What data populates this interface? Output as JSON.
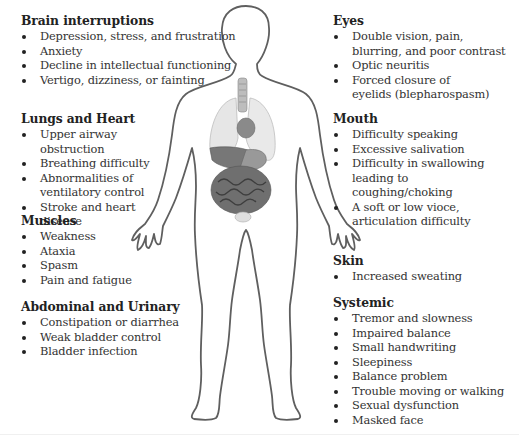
{
  "figure": {
    "outline_color": "#5a5a5a",
    "organ_colors": {
      "lungs": "#e4e4e4",
      "liver": "#7a7a7a",
      "stomach": "#8c8c8c",
      "intestines": "#6e6e6e",
      "bladder": "#dcdcdc"
    }
  },
  "sections": {
    "brain": {
      "title": "Brain interruptions",
      "items": [
        "Depression, stress, and frustration",
        "Anxiety",
        "Decline in intellectual functioning",
        "Vertigo, dizziness, or fainting"
      ]
    },
    "lungs_heart": {
      "title": "Lungs and Heart",
      "items": [
        "Upper airway obstruction",
        "Breathing difficulty",
        "Abnormalities of ventilatory control",
        "Stroke and heart disease"
      ]
    },
    "muscles": {
      "title": "Muscles",
      "items": [
        "Weakness",
        "Ataxia",
        "Spasm",
        "Pain and fatigue"
      ]
    },
    "abdominal": {
      "title": "Abdominal and Urinary",
      "items": [
        "Constipation or diarrhea",
        "Weak bladder control",
        "Bladder infection"
      ]
    },
    "eyes": {
      "title": "Eyes",
      "items": [
        "Double vision, pain, blurring, and poor contrast",
        "Optic neuritis",
        "Forced closure of eyelids (blepharospasm)"
      ]
    },
    "mouth": {
      "title": "Mouth",
      "items": [
        "Difficulty speaking",
        "Excessive salivation",
        "Difficulty in swallowing leading to coughing/choking",
        "A soft or low vioce, articulation difficulty"
      ]
    },
    "skin": {
      "title": "Skin",
      "items": [
        "Increased sweating"
      ]
    },
    "systemic": {
      "title": "Systemic",
      "items": [
        "Tremor and slowness",
        "Impaired balance",
        "Small handwriting",
        "Sleepiness",
        "Balance problem",
        "Trouble moving or walking",
        "Sexual dysfunction",
        "Masked face"
      ]
    }
  }
}
